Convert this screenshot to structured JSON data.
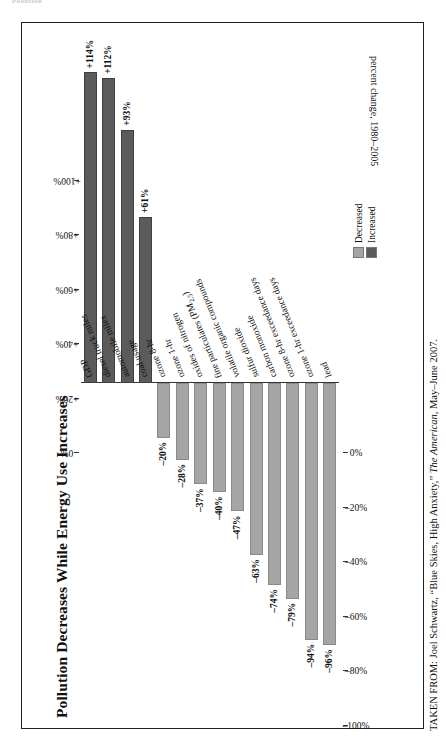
{
  "running_head": "Pollution",
  "figure": {
    "title": "Pollution Decreases While Energy Use Increases",
    "axis_caption": "percent change, 1980–2005",
    "source_prefix": "TAKEN FROM: Joel Schwartz, “Blue Skies, High Anxiety,” ",
    "source_italic": "The American",
    "source_suffix": ", May–June 2007."
  },
  "legend": {
    "items": [
      {
        "label": "Decreased",
        "color": "#a5a5a5"
      },
      {
        "label": "Increased",
        "color": "#5b5b5b"
      }
    ]
  },
  "colors": {
    "increased": "#5b5b5b",
    "decreased": "#a5a5a5",
    "frame": "#222222",
    "axis": "#333333"
  },
  "chart_data": {
    "type": "bar",
    "orientation": "horizontal",
    "title": "Pollution Decreases While Energy Use Increases",
    "xlabel": "percent change, 1980–2005",
    "ylabel": "",
    "xlim": [
      -100,
      120
    ],
    "grid": false,
    "legend_position": "bottom-right",
    "axis_ticks_positive": [
      "+100%",
      "+80%",
      "+60%",
      "+40%",
      "+20%",
      "0%"
    ],
    "axis_ticks_negative": [
      "0%",
      "–20%",
      "–40%",
      "–60%",
      "–80%",
      "–100%"
    ],
    "tick_values_positive": [
      100,
      80,
      60,
      40,
      20,
      0
    ],
    "tick_values_negative": [
      0,
      -20,
      -40,
      -60,
      -80,
      -100
    ],
    "categories": [
      "GDP",
      "diesel truck miles",
      "automobile miles",
      "coal usage",
      "ozone 8-hr",
      "ozone 1-hr",
      "oxides of nitrogen",
      "fine particulates (PM2.5)",
      "volatile organic compounds",
      "sulfur dioxide",
      "carbon monoxide",
      "ozone 8-hr exceedance days",
      "ozone 1-hr exceedance days",
      "lead"
    ],
    "values": [
      114,
      112,
      93,
      61,
      -20,
      -28,
      -37,
      -40,
      -47,
      -63,
      -74,
      -79,
      -94,
      -96
    ],
    "value_labels": [
      "+114%",
      "+112%",
      "+93%",
      "+61%",
      "–20%",
      "–28%",
      "–37%",
      "–40%",
      "–47%",
      "–63%",
      "–74%",
      "–79%",
      "–94%",
      "–96%"
    ],
    "series_groups": [
      {
        "name": "Increased",
        "categories": [
          "GDP",
          "diesel truck miles",
          "automobile miles",
          "coal usage"
        ]
      },
      {
        "name": "Decreased",
        "categories": [
          "ozone 8-hr",
          "ozone 1-hr",
          "oxides of nitrogen",
          "fine particulates (PM2.5)",
          "volatile organic compounds",
          "sulfur dioxide",
          "carbon monoxide",
          "ozone 8-hr exceedance days",
          "ozone 1-hr exceedance days",
          "lead"
        ]
      }
    ]
  }
}
